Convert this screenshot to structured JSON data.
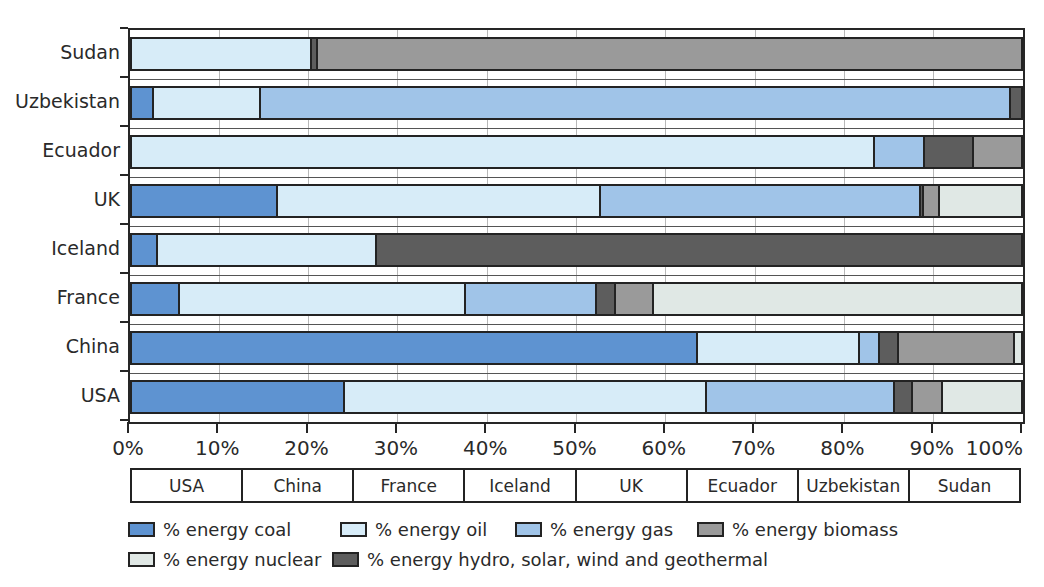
{
  "chart_data": {
    "type": "bar",
    "orientation": "horizontal",
    "stacked": true,
    "unit": "%",
    "title": "",
    "categories_top_to_bottom": [
      "Sudan",
      "Uzbekistan",
      "Ecuador",
      "UK",
      "Iceland",
      "France",
      "China",
      "USA"
    ],
    "x_axis": {
      "min": 0,
      "max": 100,
      "tick_step": 10,
      "tick_labels": [
        "0%",
        "10%",
        "20%",
        "30%",
        "40%",
        "50%",
        "60%",
        "70%",
        "80%",
        "90%",
        "100%"
      ],
      "grid": true
    },
    "stack_order_left_to_right": [
      "coal",
      "oil",
      "gas",
      "hydro",
      "biomass",
      "nuclear"
    ],
    "series": [
      {
        "key": "coal",
        "name": "% energy coal",
        "color": "#5e93d1",
        "values": [
          0,
          2.2,
          0,
          16.2,
          2.7,
          5.2,
          63.4,
          23.7
        ]
      },
      {
        "key": "oil",
        "name": "% energy oil",
        "color": "#d7ecf8",
        "values": [
          20.0,
          12.1,
          83.4,
          36.3,
          24.6,
          32.2,
          18.3,
          40.8
        ]
      },
      {
        "key": "gas",
        "name": "% energy gas",
        "color": "#a0c4e8",
        "values": [
          0,
          84.4,
          5.6,
          36.0,
          0,
          14.7,
          2.2,
          21.1
        ]
      },
      {
        "key": "hydro",
        "name": "% energy hydro, solar, wind and geothermal",
        "color": "#5d5d5d",
        "values": [
          0.7,
          1.3,
          5.5,
          0.4,
          72.7,
          2.1,
          2.2,
          2.0
        ]
      },
      {
        "key": "biomass",
        "name": "% energy biomass",
        "color": "#9a9a9a",
        "values": [
          79.3,
          0,
          5.5,
          1.8,
          0,
          4.3,
          13.0,
          3.4
        ]
      },
      {
        "key": "nuclear",
        "name": "% energy nuclear",
        "color": "#e0e8e5",
        "values": [
          0,
          0,
          0,
          9.3,
          0,
          41.5,
          0.9,
          9.0
        ]
      }
    ]
  },
  "footer_table": {
    "cells": [
      "USA",
      "China",
      "France",
      "Iceland",
      "UK",
      "Ecuador",
      "Uzbekistan",
      "Sudan"
    ]
  },
  "legend": {
    "rows": [
      [
        {
          "key": "coal",
          "label": "% energy coal",
          "color": "#5e93d1"
        },
        {
          "key": "oil",
          "label": "% energy oil",
          "color": "#d7ecf8"
        },
        {
          "key": "gas",
          "label": "% energy gas",
          "color": "#a0c4e8"
        },
        {
          "key": "biomass",
          "label": "% energy biomass",
          "color": "#9a9a9a"
        }
      ],
      [
        {
          "key": "nuclear",
          "label": "% energy nuclear",
          "color": "#e0e8e5"
        },
        {
          "key": "hydro",
          "label": "% energy hydro, solar, wind and geothermal",
          "color": "#5d5d5d"
        }
      ]
    ]
  },
  "colors": {
    "bar_border": "#232323",
    "grid_line": "#b8b8b8",
    "row_separator": "#555555",
    "text": "#2a2a2a",
    "background": "#ffffff"
  }
}
